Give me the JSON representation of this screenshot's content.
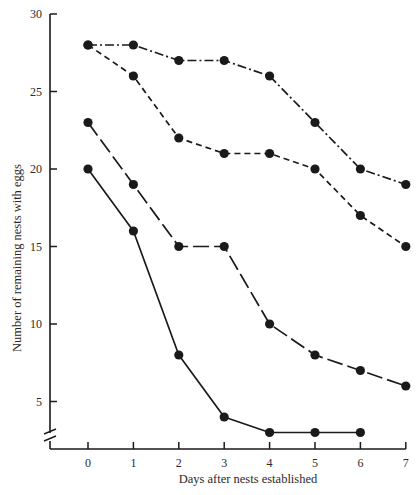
{
  "chart_data": {
    "type": "line",
    "title": "",
    "xlabel": "Days after nests established",
    "ylabel": "Number of remaining nests with eggs",
    "x": [
      0,
      1,
      2,
      3,
      4,
      5,
      6,
      7
    ],
    "x_ticks": [
      "0",
      "1",
      "2",
      "3",
      "4",
      "5",
      "6",
      "7"
    ],
    "y_ticks": [
      "5",
      "10",
      "15",
      "20",
      "25",
      "30"
    ],
    "ylim": [
      2.5,
      30
    ],
    "xlim": [
      -0.85,
      7
    ],
    "grid": false,
    "legend": "none",
    "y_axis_break": true,
    "series": [
      {
        "name": "dash-dot series",
        "line_style": "dash-dot",
        "x": [
          0,
          1,
          2,
          3,
          4,
          5,
          6,
          7
        ],
        "values": [
          28,
          28,
          27,
          27,
          26,
          23,
          20,
          19
        ]
      },
      {
        "name": "short-dash series",
        "line_style": "short-dash",
        "x": [
          0,
          1,
          2,
          3,
          4,
          5,
          6,
          7
        ],
        "values": [
          28,
          26,
          22,
          21,
          21,
          20,
          17,
          15
        ]
      },
      {
        "name": "long-dash series",
        "line_style": "long-dash",
        "x": [
          0,
          1,
          2,
          3,
          4,
          5,
          6,
          7
        ],
        "values": [
          23,
          19,
          15,
          15,
          10,
          8,
          7,
          6
        ]
      },
      {
        "name": "solid series",
        "line_style": "solid",
        "x": [
          0,
          1,
          2,
          3,
          4,
          5,
          6
        ],
        "values": [
          20,
          16,
          8,
          4,
          3,
          3,
          3
        ]
      }
    ]
  },
  "style": {
    "ink_color": "#1a1a1a",
    "background": "#ffffff"
  }
}
